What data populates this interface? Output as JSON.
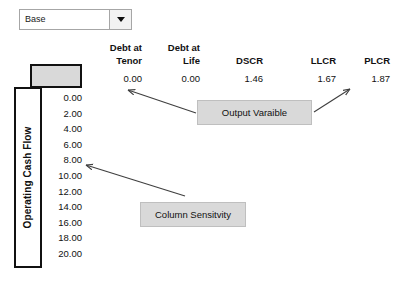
{
  "scenario_selector": {
    "selected": "Base",
    "caret_icon": "chevron-down-icon"
  },
  "table": {
    "columns": [
      {
        "header_line1": "Debt at",
        "header_line2": "Tenor",
        "value": "0.00"
      },
      {
        "header_line1": "Debt at",
        "header_line2": "Life",
        "value": "0.00"
      },
      {
        "header_line1": "",
        "header_line2": "DSCR",
        "value": "1.46"
      },
      {
        "header_line1": "",
        "header_line2": "LLCR",
        "value": "1.67"
      },
      {
        "header_line1": "",
        "header_line2": "PLCR",
        "value": "1.87"
      }
    ]
  },
  "left_panel": {
    "axis_label": "Operating Cash Flow",
    "values": [
      "0.00",
      "2.00",
      "4.00",
      "6.00",
      "8.00",
      "10.00",
      "12.00",
      "14.00",
      "16.00",
      "18.00",
      "20.00"
    ]
  },
  "annotations": {
    "output_variable": "Output Varaible",
    "column_sensitivity": "Column Sensitvity"
  },
  "colors": {
    "gray_fill": "#d9d9d9",
    "border_dark": "#111111",
    "arrow": "#3f3f3f"
  }
}
